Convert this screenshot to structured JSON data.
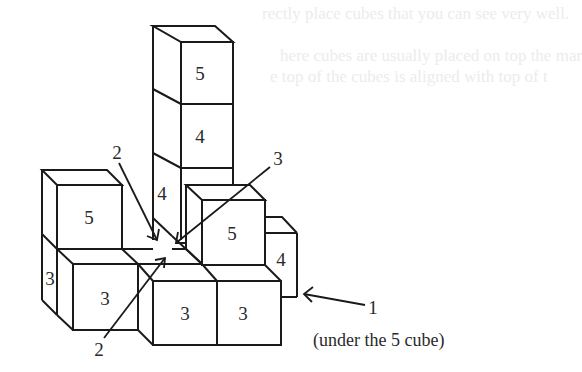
{
  "background_text": {
    "line1": "rectly place cubes that you can see very well.",
    "line2": "here cubes are usually placed on top the mar",
    "line3": "e top of the cubes is aligned with top of t"
  },
  "figure": {
    "cube_labels": {
      "tall_top": "5",
      "tall_middle": "4",
      "tall_side": "4",
      "left_top": "5",
      "left_side": "3",
      "left_front": "3",
      "center_front_left": "3",
      "center_front_right": "3",
      "right_top": "5",
      "right_side": "4"
    },
    "callouts": {
      "callout_2_top": "2",
      "callout_2_bottom": "2",
      "callout_3": "3",
      "callout_1": "1",
      "callout_1_note": "(under the 5 cube)"
    },
    "colors": {
      "line": "#1a1a1a",
      "text": "#2a2a2a",
      "ghost_text": "#ececec"
    }
  }
}
